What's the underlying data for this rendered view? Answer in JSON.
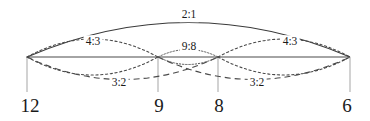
{
  "diagram": {
    "type": "musical-interval-ratio-diagram",
    "baseline": {
      "x1": 27,
      "x2": 350,
      "y": 57
    },
    "colors": {
      "stroke": "#3a3a3a",
      "text": "#1a1a1a",
      "tick": "#9a9a9a",
      "background": "#ffffff"
    },
    "nodes": [
      {
        "id": "n12",
        "label": "12",
        "x": 27,
        "label_x": 30,
        "label_y": 105
      },
      {
        "id": "n9",
        "label": "9",
        "x": 158,
        "label_x": 159,
        "label_y": 105
      },
      {
        "id": "n8",
        "label": "8",
        "x": 218,
        "label_x": 219,
        "label_y": 105
      },
      {
        "id": "n6",
        "label": "6",
        "x": 350,
        "label_x": 347,
        "label_y": 105
      }
    ],
    "ticks": [
      {
        "x": 27,
        "y1": 57,
        "y2": 92
      },
      {
        "x": 158,
        "y1": 57,
        "y2": 92
      },
      {
        "x": 218,
        "y1": 57,
        "y2": 92
      },
      {
        "x": 350,
        "y1": 57,
        "y2": 92
      }
    ],
    "arcs": [
      {
        "id": "arc-2-1",
        "ratio": "2:1",
        "from": "n12",
        "to": "n6",
        "side": "above",
        "style": "solid",
        "label_x": 189,
        "label_y": 15
      },
      {
        "id": "arc-4-3-left",
        "ratio": "4:3",
        "from": "n12",
        "to": "n9",
        "side": "above",
        "style": "dotted",
        "label_x": 93,
        "label_y": 42
      },
      {
        "id": "arc-4-3-right",
        "ratio": "4:3",
        "from": "n8",
        "to": "n6",
        "side": "above",
        "style": "dotted",
        "label_x": 290,
        "label_y": 42
      },
      {
        "id": "arc-9-8",
        "ratio": "9:8",
        "from": "n9",
        "to": "n8",
        "side": "lens",
        "style": "dotted",
        "label_x": 189,
        "label_y": 47
      },
      {
        "id": "arc-3-2-left",
        "ratio": "3:2",
        "from": "n12",
        "to": "n8",
        "side": "below",
        "style": "dashed",
        "label_x": 119,
        "label_y": 83
      },
      {
        "id": "arc-3-2-right",
        "ratio": "3:2",
        "from": "n9",
        "to": "n6",
        "side": "below",
        "style": "dashed",
        "label_x": 257,
        "label_y": 83
      },
      {
        "id": "arc-lower-left",
        "ratio": "",
        "from": "n12",
        "to": "n9",
        "side": "below",
        "style": "dotted",
        "label_x": 0,
        "label_y": 0
      },
      {
        "id": "arc-lower-right",
        "ratio": "",
        "from": "n8",
        "to": "n6",
        "side": "below",
        "style": "dotted",
        "label_x": 0,
        "label_y": 0
      }
    ],
    "labels": {
      "octave": "2:1",
      "fourth_left": "4:3",
      "fourth_right": "4:3",
      "tone": "9:8",
      "fifth_left": "3:2",
      "fifth_right": "3:2",
      "node_12": "12",
      "node_9": "9",
      "node_8": "8",
      "node_6": "6"
    }
  }
}
